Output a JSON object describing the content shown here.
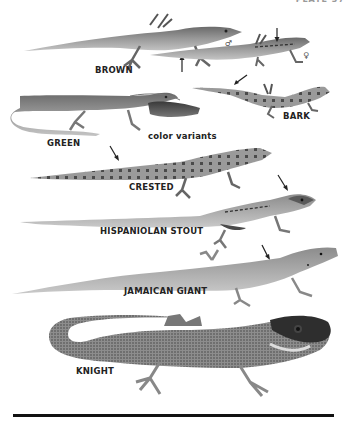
{
  "plate": {
    "header": "PLATE 37"
  },
  "species": [
    {
      "id": "brown",
      "label": "BROWN",
      "sex_symbols": [
        "♂",
        "♀"
      ]
    },
    {
      "id": "bark",
      "label": "BARK"
    },
    {
      "id": "green",
      "label": "GREEN",
      "note": "color variants"
    },
    {
      "id": "crested",
      "label": "CRESTED"
    },
    {
      "id": "hispaniolan-stout",
      "label": "HISPANIOLAN STOUT"
    },
    {
      "id": "jamaican-giant",
      "label": "JAMAICAN GIANT"
    },
    {
      "id": "knight",
      "label": "KNIGHT"
    }
  ],
  "colors": {
    "ink": "#222222",
    "lizard_dark": "#555555",
    "lizard_mid": "#8a8a8a",
    "lizard_light": "#b5b5b5",
    "rule": "#111111"
  }
}
